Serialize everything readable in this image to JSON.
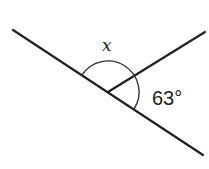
{
  "diagram": {
    "type": "angle-diagram",
    "labels": {
      "unknown_angle": "x",
      "known_angle": "63°"
    },
    "angles": {
      "known_degrees": 63,
      "straight_line_degrees": 180
    },
    "colors": {
      "line": "#222222",
      "background": "#ffffff"
    }
  }
}
